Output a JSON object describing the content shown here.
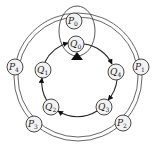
{
  "diagram": {
    "type": "ring-topology",
    "outer_ring": {
      "center": [
        78,
        76
      ],
      "radii": [
        60,
        64
      ],
      "nodes": [
        {
          "id": "P0",
          "base": "P",
          "sub": "0",
          "x": 74,
          "y": 21
        },
        {
          "id": "P1",
          "base": "P",
          "sub": "1",
          "x": 141,
          "y": 67
        },
        {
          "id": "P2",
          "base": "P",
          "sub": "2",
          "x": 123,
          "y": 123
        },
        {
          "id": "P3",
          "base": "P",
          "sub": "3",
          "x": 34,
          "y": 124
        },
        {
          "id": "P4",
          "base": "P",
          "sub": "4",
          "x": 15,
          "y": 67
        }
      ]
    },
    "inner_ring": {
      "center": [
        78,
        76
      ],
      "radius": 36,
      "direction": "clockwise",
      "nodes": [
        {
          "id": "Q0",
          "base": "Q",
          "sub": "0",
          "x": 76,
          "y": 44
        },
        {
          "id": "Q4",
          "base": "Q",
          "sub": "4",
          "x": 116,
          "y": 72
        },
        {
          "id": "Q3",
          "base": "Q",
          "sub": "3",
          "x": 104,
          "y": 107
        },
        {
          "id": "Q2",
          "base": "Q",
          "sub": "2",
          "x": 51,
          "y": 107
        },
        {
          "id": "Q1",
          "base": "Q",
          "sub": "1",
          "x": 43,
          "y": 70
        }
      ],
      "edges": [
        {
          "from": "Q0",
          "to": "Q4"
        },
        {
          "from": "Q4",
          "to": "Q3"
        },
        {
          "from": "Q3",
          "to": "Q2"
        },
        {
          "from": "Q2",
          "to": "Q1"
        },
        {
          "from": "Q1",
          "to": "Q0"
        }
      ]
    },
    "enclosure": {
      "around": [
        "P0",
        "Q0"
      ],
      "cx": 77,
      "cy": 31,
      "rx": 18,
      "ry": 25
    },
    "marker": {
      "type": "filled-triangle",
      "at": "Q0",
      "color": "#111111"
    }
  }
}
